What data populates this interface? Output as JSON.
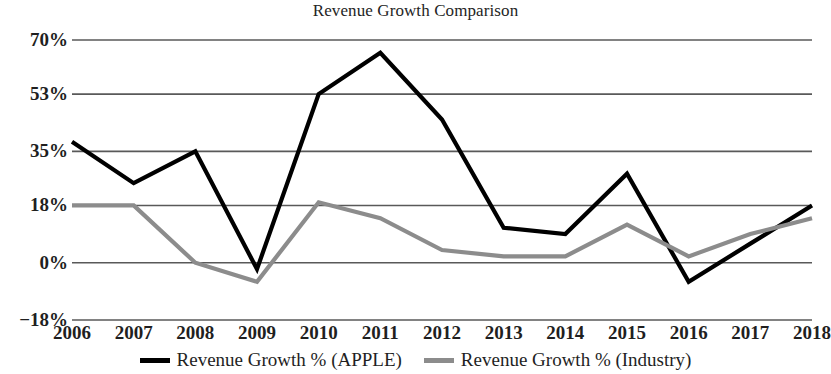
{
  "chart_data": {
    "type": "line",
    "title": "Revenue Growth Comparison",
    "xlabel": "",
    "ylabel": "",
    "grid": true,
    "legend_position": "bottom",
    "x": [
      2006,
      2007,
      2008,
      2009,
      2010,
      2011,
      2012,
      2013,
      2014,
      2015,
      2016,
      2017,
      2018
    ],
    "categories": [
      "2006",
      "2007",
      "2008",
      "2009",
      "2010",
      "2011",
      "2012",
      "2013",
      "2014",
      "2015",
      "2016",
      "2017",
      "2018"
    ],
    "ylim": [
      -18,
      70
    ],
    "ytick_values": [
      70,
      53,
      35,
      18,
      0,
      -18
    ],
    "ytick_labels": [
      "70%",
      "53%",
      "35%",
      "18%",
      "0%",
      "−18%"
    ],
    "series": [
      {
        "name": "Revenue Growth % (APPLE)",
        "color": "#000000",
        "width": 4.2,
        "values": [
          38,
          25,
          35,
          -2,
          53,
          66,
          45,
          11,
          9,
          28,
          -6,
          6,
          18
        ]
      },
      {
        "name": "Revenue Growth % (Industry)",
        "color": "#8c8c8c",
        "width": 4.2,
        "values": [
          18,
          18,
          0,
          -6,
          19,
          14,
          4,
          2,
          2,
          12,
          2,
          9,
          14
        ]
      }
    ]
  },
  "legend": {
    "items": [
      {
        "label": "Revenue Growth % (APPLE)",
        "color": "#000000"
      },
      {
        "label": "Revenue Growth % (Industry)",
        "color": "#8c8c8c"
      }
    ]
  },
  "axis": {
    "gridline_color": "#595959",
    "y_labels": [
      "70%",
      "53%",
      "35%",
      "18%",
      "0%",
      "−18%"
    ],
    "x_labels": [
      "2006",
      "2007",
      "2008",
      "2009",
      "2010",
      "2011",
      "2012",
      "2013",
      "2014",
      "2015",
      "2016",
      "2017",
      "2018"
    ]
  }
}
